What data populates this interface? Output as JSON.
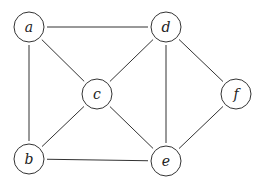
{
  "graph": {
    "nodes": [
      {
        "id": "a",
        "label": "a",
        "x": 29,
        "y": 27
      },
      {
        "id": "b",
        "label": "b",
        "x": 29,
        "y": 159
      },
      {
        "id": "c",
        "label": "c",
        "x": 97,
        "y": 94
      },
      {
        "id": "d",
        "label": "d",
        "x": 166,
        "y": 27
      },
      {
        "id": "e",
        "label": "e",
        "x": 166,
        "y": 161
      },
      {
        "id": "f",
        "label": "f",
        "x": 236,
        "y": 94
      }
    ],
    "edges": [
      [
        "a",
        "d"
      ],
      [
        "a",
        "c"
      ],
      [
        "a",
        "b"
      ],
      [
        "d",
        "c"
      ],
      [
        "d",
        "e"
      ],
      [
        "d",
        "f"
      ],
      [
        "c",
        "b"
      ],
      [
        "c",
        "e"
      ],
      [
        "b",
        "e"
      ],
      [
        "f",
        "e"
      ]
    ],
    "node_radius": 15
  }
}
